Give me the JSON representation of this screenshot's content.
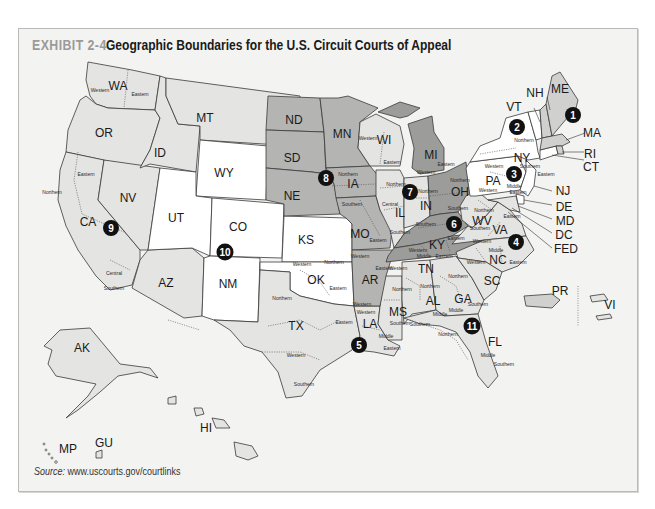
{
  "header": {
    "exhibit_number": "EXHIBIT 2-4",
    "title": "Geographic Boundaries for the U.S. Circuit Courts of Appeal"
  },
  "source": {
    "label": "Source:",
    "url": "www.uscourts.gov/courtlinks"
  },
  "colors": {
    "frame_bg": "#f3f3f1",
    "tone_white": "#ffffff",
    "tone_light": "#e4e4e2",
    "tone_mid": "#d0d0ce",
    "tone_dark": "#b4b4b2",
    "tone_darkest": "#9c9c9a",
    "circuit_marker": "#111111"
  },
  "circuits": [
    {
      "number": "1",
      "states": [
        "ME",
        "NH",
        "MA",
        "RI",
        "PR"
      ]
    },
    {
      "number": "2",
      "states": [
        "VT",
        "NY",
        "CT"
      ]
    },
    {
      "number": "3",
      "states": [
        "PA",
        "NJ",
        "DE",
        "VI"
      ]
    },
    {
      "number": "4",
      "states": [
        "MD",
        "VA",
        "WV",
        "NC",
        "SC"
      ]
    },
    {
      "number": "5",
      "states": [
        "TX",
        "LA",
        "MS"
      ]
    },
    {
      "number": "6",
      "states": [
        "OH",
        "MI",
        "KY",
        "TN"
      ]
    },
    {
      "number": "7",
      "states": [
        "WI",
        "IL",
        "IN"
      ]
    },
    {
      "number": "8",
      "states": [
        "ND",
        "SD",
        "NE",
        "MN",
        "IA",
        "MO",
        "AR"
      ]
    },
    {
      "number": "9",
      "states": [
        "WA",
        "OR",
        "CA",
        "NV",
        "ID",
        "MT",
        "AZ",
        "AK",
        "HI",
        "GU",
        "MP"
      ]
    },
    {
      "number": "10",
      "states": [
        "WY",
        "UT",
        "CO",
        "KS",
        "OK",
        "NM"
      ]
    },
    {
      "number": "11",
      "states": [
        "AL",
        "GA",
        "FL"
      ]
    }
  ],
  "state_labels": {
    "WA": "WA",
    "OR": "OR",
    "CA": "CA",
    "NV": "NV",
    "ID": "ID",
    "MT": "MT",
    "WY": "WY",
    "UT": "UT",
    "CO": "CO",
    "AZ": "AZ",
    "NM": "NM",
    "ND": "ND",
    "SD": "SD",
    "NE": "NE",
    "KS": "KS",
    "OK": "OK",
    "TX": "TX",
    "MN": "MN",
    "IA": "IA",
    "MO": "MO",
    "AR": "AR",
    "LA": "LA",
    "WI": "WI",
    "IL": "IL",
    "MI": "MI",
    "IN": "IN",
    "OH": "OH",
    "KY": "KY",
    "TN": "TN",
    "MS": "MS",
    "AL": "AL",
    "GA": "GA",
    "FL": "FL",
    "SC": "SC",
    "NC": "NC",
    "VA": "VA",
    "WV": "WV",
    "PA": "PA",
    "NY": "NY",
    "VT": "VT",
    "NH": "NH",
    "ME": "ME",
    "MA": "MA",
    "RI": "RI",
    "CT": "CT",
    "NJ": "NJ",
    "DE": "DE",
    "MD": "MD",
    "DC": "DC",
    "FED": "FED",
    "AK": "AK",
    "HI": "HI",
    "PR": "PR",
    "VI": "VI",
    "GU": "GU",
    "MP": "MP"
  },
  "district_labels": {
    "wa_w": "Western",
    "wa_e": "Eastern",
    "ca_n": "Northern",
    "ca_e": "Eastern",
    "ca_c": "Central",
    "ca_s": "Southern",
    "wi_w": "Western",
    "wi_e": "Eastern",
    "mi_w": "Western",
    "mi_e": "Eastern",
    "ia_n": "Northern",
    "ia_s": "Southern",
    "il_n": "Northern",
    "il_c": "Central",
    "il_s": "Southern",
    "in_n": "Northern",
    "in_s": "Southern",
    "oh_n": "Northern",
    "oh_s": "Southern",
    "mo_e": "Eastern",
    "mo_w": "Western",
    "ky_e": "Eastern",
    "ky_w": "Western",
    "tn_w": "Western",
    "tn_m": "Middle",
    "tn_e": "Eastern",
    "ar_e": "Eastern",
    "ar_w": "Western",
    "ok_w": "Western",
    "ok_n": "Northern",
    "ok_e": "Eastern",
    "tx_n": "Northern",
    "tx_e": "Eastern",
    "tx_w": "Western",
    "tx_s": "Southern",
    "la_w": "Western",
    "la_m": "Middle",
    "la_e": "Eastern",
    "ms_n": "Northern",
    "ms_s": "Southern",
    "al_n": "Northern",
    "al_m": "Middle",
    "al_s": "Southern",
    "ga_n": "Northern",
    "ga_m": "Middle",
    "ga_s": "Southern",
    "fl_n": "Northern",
    "fl_m": "Middle",
    "fl_s": "Southern",
    "ny_n": "Northern",
    "ny_w": "Western",
    "ny_s": "Southern",
    "ny_e": "Eastern",
    "pa_w": "Western",
    "pa_m": "Middle",
    "pa_e": "Eastern",
    "wv_n": "Northern",
    "wv_s": "Southern",
    "va_w": "Western",
    "va_e": "Eastern",
    "nc_w": "Western",
    "nc_m": "Middle",
    "nc_e": "Eastern"
  }
}
